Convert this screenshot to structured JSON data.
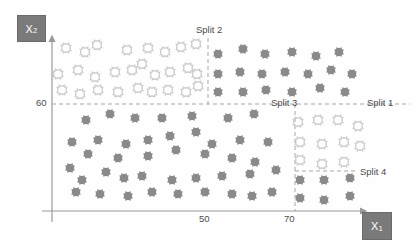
{
  "figure": {
    "type": "scatter"
  },
  "axes": {
    "x": {
      "label": "X",
      "subscript": "1",
      "ticks": [
        "50",
        "70"
      ],
      "tick_values": [
        50,
        70
      ]
    },
    "y": {
      "label": "X",
      "subscript": "2",
      "ticks": [
        "60"
      ],
      "tick_values": [
        60
      ]
    }
  },
  "splits": [
    {
      "id": "split1",
      "label": "Split 1",
      "orientation": "horizontal",
      "value": 60
    },
    {
      "id": "split2",
      "label": "Split 2",
      "orientation": "vertical",
      "value": 50
    },
    {
      "id": "split3",
      "label": "Split 3",
      "orientation": "vertical",
      "value": 70
    },
    {
      "id": "split4",
      "label": "Split 4",
      "orientation": "horizontal",
      "value": 30
    }
  ],
  "colors": {
    "marker_dark": "#8a8a8a",
    "marker_light": "#cbcbcb",
    "axis": "#9a9a9a",
    "dashed": "#a8a8a8",
    "label_box_bg": "#7a7a7a",
    "label_box_text": "#ffffff",
    "text": "#4d4d4d",
    "background": "#fefefe"
  },
  "chart_data": {
    "type": "scatter",
    "title": "",
    "xlabel": "X1",
    "ylabel": "X2",
    "xlim": [
      40,
      85
    ],
    "ylim": [
      20,
      80
    ],
    "grid": false,
    "legend": "none",
    "annotations": [
      "Split 1",
      "Split 2",
      "Split 3",
      "Split 4"
    ],
    "series": [
      {
        "name": "region-top-left-light",
        "style": "light",
        "points": [
          [
            66,
            48
          ],
          [
            85,
            52
          ],
          [
            97,
            45
          ],
          [
            127,
            50
          ],
          [
            148,
            48
          ],
          [
            165,
            52
          ],
          [
            181,
            47
          ],
          [
            196,
            44
          ],
          [
            58,
            74
          ],
          [
            78,
            70
          ],
          [
            95,
            77
          ],
          [
            115,
            72
          ],
          [
            132,
            70
          ],
          [
            155,
            75
          ],
          [
            142,
            64
          ],
          [
            170,
            72
          ],
          [
            188,
            68
          ],
          [
            197,
            74
          ],
          [
            62,
            90
          ],
          [
            80,
            94
          ],
          [
            98,
            90
          ],
          [
            118,
            92
          ],
          [
            138,
            88
          ],
          [
            152,
            92
          ],
          [
            168,
            90
          ],
          [
            186,
            92
          ],
          [
            198,
            86
          ]
        ]
      },
      {
        "name": "region-top-right-dark",
        "style": "dark",
        "points": [
          [
            218,
            54
          ],
          [
            243,
            49
          ],
          [
            265,
            54
          ],
          [
            292,
            52
          ],
          [
            316,
            56
          ],
          [
            339,
            52
          ],
          [
            218,
            74
          ],
          [
            240,
            72
          ],
          [
            262,
            74
          ],
          [
            285,
            72
          ],
          [
            308,
            74
          ],
          [
            331,
            70
          ],
          [
            352,
            74
          ],
          [
            218,
            92
          ],
          [
            243,
            92
          ],
          [
            266,
            90
          ],
          [
            292,
            92
          ],
          [
            320,
            88
          ],
          [
            345,
            92
          ]
        ]
      },
      {
        "name": "region-bottom-left-dark",
        "style": "dark",
        "points": [
          [
            86,
            120
          ],
          [
            110,
            114
          ],
          [
            135,
            118
          ],
          [
            162,
            118
          ],
          [
            192,
            116
          ],
          [
            228,
            118
          ],
          [
            254,
            114
          ],
          [
            72,
            142
          ],
          [
            98,
            140
          ],
          [
            126,
            144
          ],
          [
            148,
            140
          ],
          [
            170,
            136
          ],
          [
            196,
            132
          ],
          [
            212,
            144
          ],
          [
            240,
            140
          ],
          [
            268,
            142
          ],
          [
            88,
            154
          ],
          [
            118,
            158
          ],
          [
            148,
            156
          ],
          [
            176,
            150
          ],
          [
            205,
            154
          ],
          [
            232,
            158
          ],
          [
            255,
            162
          ],
          [
            70,
            168
          ],
          [
            82,
            180
          ],
          [
            106,
            172
          ],
          [
            124,
            178
          ],
          [
            142,
            176
          ],
          [
            172,
            180
          ],
          [
            196,
            178
          ],
          [
            222,
            176
          ],
          [
            250,
            174
          ],
          [
            276,
            170
          ],
          [
            76,
            192
          ],
          [
            100,
            194
          ],
          [
            128,
            196
          ],
          [
            152,
            192
          ],
          [
            178,
            194
          ],
          [
            205,
            192
          ],
          [
            232,
            194
          ],
          [
            252,
            196
          ],
          [
            272,
            192
          ]
        ]
      },
      {
        "name": "region-bottom-right-upper-light",
        "style": "light",
        "points": [
          [
            298,
            122
          ],
          [
            318,
            120
          ],
          [
            338,
            120
          ],
          [
            358,
            126
          ],
          [
            300,
            142
          ],
          [
            322,
            144
          ],
          [
            344,
            142
          ],
          [
            360,
            146
          ],
          [
            300,
            160
          ],
          [
            322,
            164
          ],
          [
            344,
            162
          ]
        ]
      },
      {
        "name": "region-bottom-right-lower-dark",
        "style": "dark",
        "points": [
          [
            300,
            180
          ],
          [
            324,
            180
          ],
          [
            350,
            178
          ],
          [
            300,
            198
          ],
          [
            324,
            200
          ],
          [
            350,
            196
          ]
        ]
      }
    ]
  }
}
